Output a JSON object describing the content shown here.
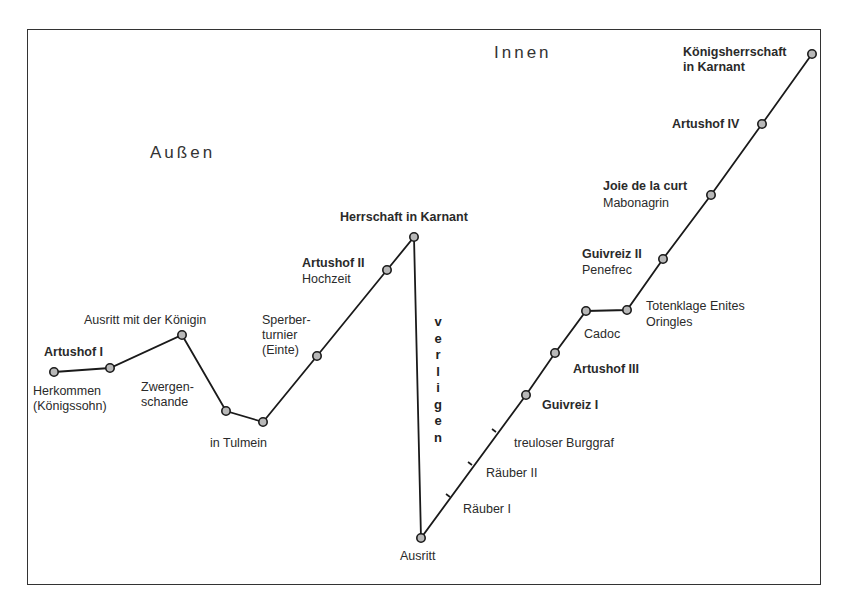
{
  "regions": {
    "outer": "Außen",
    "inner": "Innen"
  },
  "vertical_label": "verligen",
  "labels": {
    "artushof1": "Artushof I",
    "herkommen1": "Herkommen",
    "herkommen2": "(Königssohn)",
    "ausritt_koenigin": "Ausritt mit der Königin",
    "zwergen1": "Zwergen-",
    "zwergen2": "schande",
    "tulmein": "in Tulmein",
    "sperber1": "Sperber-",
    "sperber2": "turnier",
    "sperber3": "(Einte)",
    "artushof2": "Artushof II",
    "hochzeit": "Hochzeit",
    "herrschaft": "Herrschaft in Karnant",
    "ausritt": "Ausritt",
    "raeuber1": "Räuber I",
    "raeuber2": "Räuber II",
    "burggraf": "treuloser Burggraf",
    "guivreiz1": "Guivreiz I",
    "artushof3": "Artushof III",
    "cadoc": "Cadoc",
    "totenklage1": "Totenklage Enites",
    "totenklage2": "Oringles",
    "guivreiz2": "Guivreiz II",
    "penefrec": "Penefrec",
    "joie": "Joie de la curt",
    "mabonagrin": "Mabonagrin",
    "artushof4": "Artushof IV",
    "koenigsherrschaft1": "Königsherrschaft",
    "koenigsherrschaft2": "in Karnant"
  },
  "path_nodes": [
    [
      54,
      372
    ],
    [
      110,
      368
    ],
    [
      182,
      335
    ],
    [
      226,
      411
    ],
    [
      263,
      422
    ],
    [
      317,
      356
    ],
    [
      387,
      270
    ],
    [
      414,
      237
    ],
    [
      421,
      538
    ],
    [
      526,
      395
    ],
    [
      555,
      353
    ],
    [
      586,
      311
    ],
    [
      627,
      310
    ],
    [
      663,
      259
    ],
    [
      711,
      195
    ],
    [
      762,
      124
    ],
    [
      812,
      54
    ]
  ],
  "ticks": [
    [
      450,
      497
    ],
    [
      472,
      465
    ],
    [
      496,
      432
    ]
  ],
  "colors": {
    "line": "#1a1a1a",
    "node_fill": "#b8b8b8",
    "frame": "#333333"
  }
}
